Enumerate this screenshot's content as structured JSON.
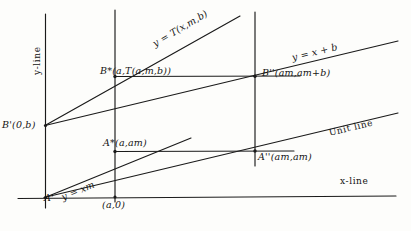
{
  "figure": {
    "kind": "geometric-construction-diagram",
    "axes": {
      "x_line_label": "x-line",
      "y_line_label": "y-line"
    },
    "lines": [
      {
        "id": "unit-line",
        "label": "Unit line",
        "equation": "y = x"
      },
      {
        "id": "slope-line",
        "label": "y = xm",
        "equation": "y = xm"
      },
      {
        "id": "shift-line",
        "label": "y = x + b",
        "equation": "y = x + b"
      },
      {
        "id": "transform-line",
        "label": "y = T(x,m,b)",
        "equation": "y = T(x,m,b)"
      }
    ],
    "points": [
      {
        "id": "A-prime",
        "label": "A'",
        "coords": "(0,0)"
      },
      {
        "id": "a-zero",
        "label": "(a,0)",
        "coords": "(a,0)"
      },
      {
        "id": "B-prime",
        "label": "B'(0,b)",
        "coords": "(0,b)"
      },
      {
        "id": "A-star",
        "label": "A*(a,am)",
        "coords": "(a,am)"
      },
      {
        "id": "A-double-prime",
        "label": "A''(am,am)",
        "coords": "(am,am)"
      },
      {
        "id": "B-star",
        "label": "B*(a,T(a,m,b))",
        "coords": "(a,T(a,m,b))"
      },
      {
        "id": "B-double-prime",
        "label": "B''(am,am+b)",
        "coords": "(am,am+b)"
      }
    ],
    "colors": {
      "ink": "#1a1a1a",
      "paper": "#fdfdfb"
    }
  }
}
